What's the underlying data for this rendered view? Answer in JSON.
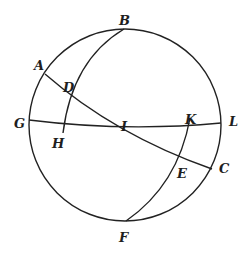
{
  "diagram": {
    "type": "spherical-geometry",
    "stroke_color": "#222222",
    "background": "#ffffff",
    "circle": {
      "cx": 125,
      "cy": 125,
      "r": 96
    },
    "labels": [
      {
        "id": "A",
        "text": "A",
        "x": 34,
        "y": 70
      },
      {
        "id": "B",
        "text": "B",
        "x": 119,
        "y": 25
      },
      {
        "id": "C",
        "text": "C",
        "x": 219,
        "y": 173
      },
      {
        "id": "D",
        "text": "D",
        "x": 63,
        "y": 92
      },
      {
        "id": "E",
        "text": "E",
        "x": 177,
        "y": 178
      },
      {
        "id": "F",
        "text": "F",
        "x": 119,
        "y": 242
      },
      {
        "id": "G",
        "text": "G",
        "x": 14,
        "y": 128
      },
      {
        "id": "H",
        "text": "H",
        "x": 52,
        "y": 148
      },
      {
        "id": "I",
        "text": "I",
        "x": 121,
        "y": 131
      },
      {
        "id": "K",
        "text": "K",
        "x": 185,
        "y": 124
      },
      {
        "id": "L",
        "text": "L",
        "x": 229,
        "y": 126
      }
    ],
    "curves": [
      {
        "id": "arc-GL",
        "d": "M 29 120 Q 125 132 221 123"
      },
      {
        "id": "arc-AC",
        "d": "M 45 74 Q 115 135 212 169"
      },
      {
        "id": "arc-BH",
        "d": "M 124 29 Q 72 60 63 133"
      },
      {
        "id": "arc-KF",
        "d": "M 190 118 Q 178 185 126 221"
      }
    ]
  }
}
